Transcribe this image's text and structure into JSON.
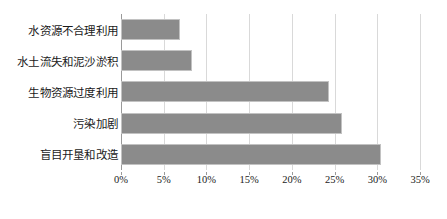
{
  "chart_data": {
    "type": "bar",
    "orientation": "horizontal",
    "title": "",
    "subtitle": "",
    "xlabel": "",
    "ylabel": "",
    "categories": [
      "水资源不合理利用",
      "水土流失和泥沙淤积",
      "生物资源过度利用",
      "污染加剧",
      "盲目开垦和改造"
    ],
    "values": [
      6.9,
      8.3,
      24.4,
      25.9,
      30.4
    ],
    "value_suffix": "%",
    "xlim": [
      0,
      35
    ],
    "xticks": [
      0,
      5,
      10,
      15,
      20,
      25,
      30,
      35
    ],
    "xtick_labels": [
      "0%",
      "5%",
      "10%",
      "15%",
      "20%",
      "25%",
      "30%",
      "35%"
    ],
    "grid": true,
    "grid_axis": "x",
    "legend": false,
    "legend_position": "none",
    "bar_color": "#8b8b8b",
    "bar_border_color": "#c2c2c2",
    "gridline_color": "#d9d9d9",
    "axis_color": "#9a9a9a",
    "background_color": "#ffffff"
  }
}
